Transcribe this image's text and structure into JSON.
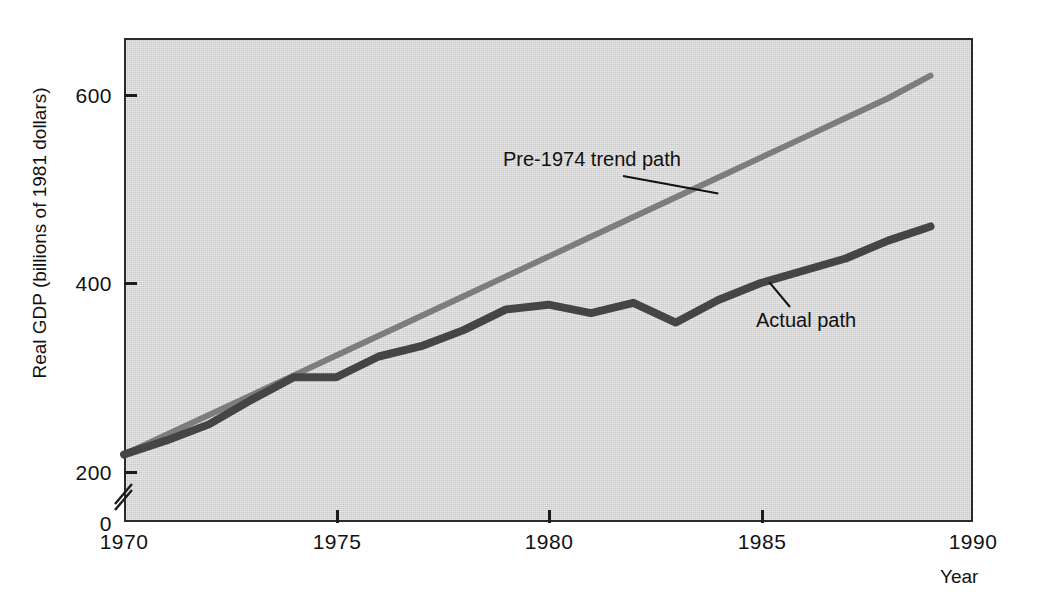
{
  "chart_data": {
    "type": "line",
    "title": "",
    "xlabel": "Year",
    "ylabel": "Real GDP (billions of 1981 dollars)",
    "xlim": [
      1970,
      1990
    ],
    "ylim": [
      0,
      660
    ],
    "y_axis_break": true,
    "y_axis_break_between": [
      0,
      200
    ],
    "grid": false,
    "legend": "annotations-inline",
    "background_color": "#c9c9c9",
    "x_ticks": [
      1970,
      1975,
      1980,
      1985,
      1990
    ],
    "x_tick_labels": [
      "1970",
      "1975",
      "1980",
      "1985",
      "1990"
    ],
    "y_ticks": [
      0,
      200,
      400,
      600
    ],
    "y_tick_labels": [
      "0",
      "200",
      "400",
      "600"
    ],
    "x": [
      1970,
      1971,
      1972,
      1973,
      1974,
      1975,
      1976,
      1977,
      1978,
      1979,
      1980,
      1981,
      1982,
      1983,
      1984,
      1985,
      1986,
      1987,
      1988,
      1989
    ],
    "series": [
      {
        "name": "Pre-1974 trend path",
        "color": "#7d7d7d",
        "width": 6,
        "values": [
          218,
          239,
          260,
          281,
          302,
          323,
          344,
          365,
          386,
          407,
          428,
          449,
          470,
          491,
          512,
          533,
          554,
          575,
          596,
          620
        ]
      },
      {
        "name": "Actual path",
        "color": "#454545",
        "width": 8,
        "values": [
          218,
          233,
          250,
          276,
          300,
          300,
          322,
          333,
          350,
          372,
          377,
          368,
          379,
          358,
          382,
          400,
          413,
          426,
          445,
          460
        ]
      }
    ],
    "annotations": [
      {
        "name": "trend-path-annotation",
        "text": "Pre-1974 trend path",
        "points_to_year": 1984,
        "points_to_value": 495
      },
      {
        "name": "actual-path-annotation",
        "text": "Actual path",
        "points_to_year": 1985.2,
        "points_to_value": 401
      }
    ]
  }
}
